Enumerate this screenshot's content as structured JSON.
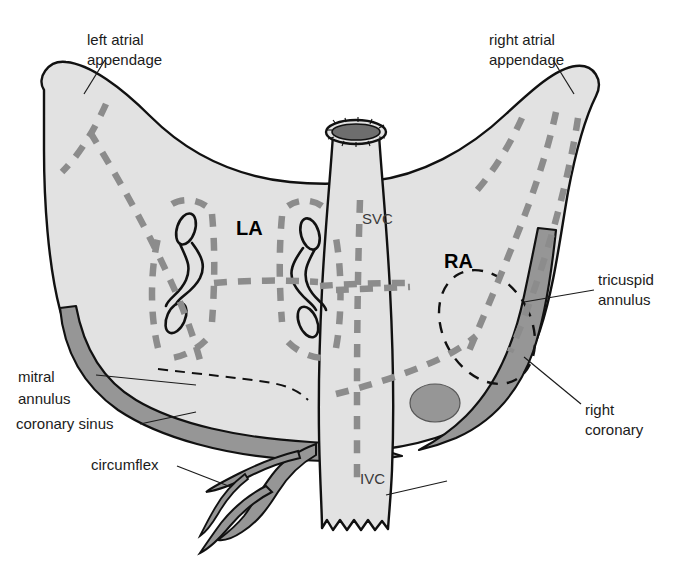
{
  "figure": {
    "background_color": "#ffffff",
    "width": 690,
    "height": 561
  },
  "colors": {
    "atrium_fill": "#e2e2e2",
    "vessel_fill": "#969696",
    "outline": "#111111",
    "ablation_dash": "#8c8c8c",
    "label_text": "#1b1b1b",
    "svc_lumen": "#6e6e6e"
  },
  "chambers": [
    {
      "id": "la",
      "label": "LA",
      "x": 236,
      "y": 235
    },
    {
      "id": "ra",
      "label": "RA",
      "x": 444,
      "y": 268
    }
  ],
  "vessels": [
    {
      "id": "svc",
      "label": "SVC",
      "x": 362,
      "y": 224
    },
    {
      "id": "ivc",
      "label": "IVC",
      "x": 360,
      "y": 484
    }
  ],
  "callouts": [
    {
      "id": "left-atrial-appendage",
      "lines": [
        "left atrial",
        "appendage"
      ],
      "text_x": 87,
      "text_y": 45,
      "leader": "M 105,60 L 84,94"
    },
    {
      "id": "right-atrial-appendage",
      "lines": [
        "right atrial",
        "appendage"
      ],
      "text_x": 489,
      "text_y": 45,
      "leader": "M 553,60 L 574,94"
    },
    {
      "id": "tricuspid-annulus",
      "lines": [
        "tricuspid",
        "annulus"
      ],
      "text_x": 598,
      "text_y": 285,
      "leader": "M 594,290 L 524,302"
    },
    {
      "id": "right-coronary",
      "lines": [
        "right",
        "coronary"
      ],
      "text_x": 585,
      "text_y": 415,
      "leader": "M 581,404 L 524,357"
    },
    {
      "id": "mitral-annulus",
      "lines": [
        "mitral",
        "annulus"
      ],
      "text_x": 18,
      "text_y": 382,
      "leader": "M 96,375 L 196,385"
    },
    {
      "id": "coronary-sinus",
      "lines": [
        "coronary sinus"
      ],
      "text_x": 16,
      "text_y": 429,
      "leader": "M 140,424 L 196,412"
    },
    {
      "id": "circumflex",
      "lines": [
        "circumflex"
      ],
      "text_x": 91,
      "text_y": 470,
      "leader": "M 177,466 L 231,487"
    },
    {
      "id": "ivc-pointer",
      "lines": [],
      "text_x": 0,
      "text_y": 0,
      "leader": "M 386,495 L 447,481"
    }
  ],
  "structures": {
    "pulmonary_veins": [
      {
        "id": "lspv",
        "cx": 186,
        "cy": 229
      },
      {
        "id": "lipv",
        "cx": 176,
        "cy": 318
      },
      {
        "id": "rspv",
        "cx": 310,
        "cy": 234
      },
      {
        "id": "ripv",
        "cx": 308,
        "cy": 322
      }
    ],
    "coronary_sinus_ostium": {
      "id": "cs-ostium",
      "cx": 435,
      "cy": 403,
      "rx": 25,
      "ry": 19
    },
    "tricuspid_annulus_ring": {
      "id": "tricuspid-ring",
      "cx": 487,
      "cy": 327,
      "rx": 44,
      "ry": 60,
      "rotate": -28
    }
  }
}
